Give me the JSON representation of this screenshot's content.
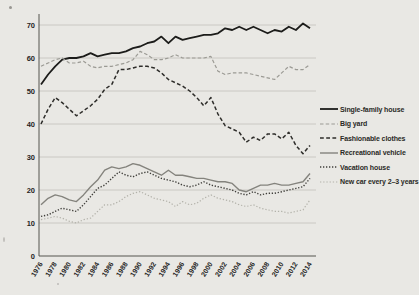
{
  "colors": {
    "background": "#e9e8e4",
    "grid": "#c6c5c0",
    "axis": "#55544e",
    "text": "#26251f"
  },
  "chart_data": {
    "type": "line",
    "title": "",
    "xlabel": "",
    "ylabel": "",
    "ylim": [
      0,
      70
    ],
    "yticks": [
      0,
      10,
      20,
      30,
      40,
      50,
      60,
      70
    ],
    "grid": "horizontal-only",
    "legend_position": "right",
    "x_tick_labels": [
      "1976",
      "1978",
      "1980",
      "1982",
      "1984",
      "1986",
      "1988",
      "1990",
      "1992",
      "1994",
      "1996",
      "1998",
      "2000",
      "2002",
      "2004",
      "2006",
      "2008",
      "2010",
      "2012",
      "2014"
    ],
    "x": [
      1976,
      1977,
      1978,
      1979,
      1980,
      1981,
      1982,
      1983,
      1984,
      1985,
      1986,
      1987,
      1988,
      1989,
      1990,
      1991,
      1992,
      1993,
      1994,
      1995,
      1996,
      1997,
      1998,
      1999,
      2000,
      2001,
      2002,
      2003,
      2004,
      2005,
      2006,
      2007,
      2008,
      2009,
      2010,
      2011,
      2012,
      2013,
      2014
    ],
    "series": [
      {
        "name": "Single-family house",
        "style": "solid",
        "color": "#1c1c1a",
        "width": 1.8,
        "dash": "",
        "values": [
          52,
          55,
          57.5,
          59.5,
          60,
          60,
          60.5,
          61.5,
          60.5,
          61,
          61.5,
          61.5,
          62,
          63,
          63.5,
          64.5,
          65,
          66.5,
          64.5,
          66.5,
          65.5,
          66,
          66.5,
          67,
          67,
          67.5,
          69,
          68.5,
          69.5,
          68.5,
          69.5,
          68.5,
          67.5,
          68.5,
          68,
          69.5,
          68.5,
          70.5,
          69
        ]
      },
      {
        "name": "Big yard",
        "style": "dashed",
        "color": "#9b9a94",
        "width": 1.2,
        "dash": "3.5,2.2",
        "values": [
          57.5,
          58.5,
          59.5,
          60,
          58.5,
          58.5,
          59,
          57.5,
          57,
          57.5,
          57.5,
          58,
          58.5,
          59.5,
          62,
          61,
          59.5,
          59.5,
          60,
          61,
          60,
          60,
          60,
          60,
          60.5,
          56,
          55,
          55.5,
          55.5,
          55.5,
          55,
          54.5,
          54,
          53.5,
          55.5,
          57.5,
          56.5,
          56.5,
          58
        ]
      },
      {
        "name": "Fashionable clothes",
        "style": "dashed",
        "color": "#2e2d2a",
        "width": 1.5,
        "dash": "3.8,2.4",
        "values": [
          40,
          44.5,
          48,
          46.5,
          44.5,
          42.5,
          44,
          45.5,
          47.5,
          50.5,
          52,
          56.5,
          56.5,
          57,
          57.5,
          57.5,
          57,
          55.5,
          53.5,
          52.5,
          51.5,
          50,
          48,
          45.5,
          48,
          43,
          39.5,
          38.5,
          37.5,
          34.5,
          36,
          35,
          37,
          37,
          35.5,
          37.5,
          33.5,
          31,
          33.5
        ]
      },
      {
        "name": "Recreational vehicle",
        "style": "solid",
        "color": "#84837d",
        "width": 1.4,
        "dash": "",
        "values": [
          15.5,
          17.5,
          18.5,
          18,
          17,
          16.5,
          18.5,
          21,
          23,
          26,
          27,
          26.5,
          27,
          28,
          27.5,
          26.5,
          25.5,
          24.5,
          26,
          24.5,
          24.5,
          24,
          23.5,
          23.5,
          23,
          22.5,
          22.5,
          22,
          20,
          19.5,
          20.5,
          21.5,
          21.5,
          22,
          21.5,
          21.5,
          22,
          22.5,
          25
        ]
      },
      {
        "name": "Vacation house",
        "style": "dotted",
        "color": "#3f3e3a",
        "width": 1.4,
        "dash": "1.3,1.7",
        "values": [
          12,
          12.5,
          13.5,
          14.5,
          14,
          13.5,
          15.5,
          18,
          20.5,
          21.5,
          23.5,
          25.5,
          24.5,
          24,
          25,
          25.5,
          24.5,
          23.5,
          23,
          22.5,
          21.5,
          21,
          21.5,
          22.5,
          21.5,
          21,
          20.5,
          20,
          19,
          18.5,
          19.5,
          18.5,
          19,
          19,
          19.5,
          20,
          20.5,
          21,
          23.5
        ]
      },
      {
        "name": "New car every 2–3 years",
        "style": "dotted",
        "color": "#b3b2aa",
        "width": 1.2,
        "dash": "1.3,1.9",
        "values": [
          11,
          11.5,
          12,
          11.5,
          10.5,
          10,
          11,
          11.5,
          13.5,
          15.5,
          15.5,
          16.5,
          18,
          19,
          19.5,
          18.5,
          17.5,
          17,
          16.5,
          15,
          16.5,
          15.5,
          16,
          17.5,
          18.5,
          17.5,
          17,
          16.5,
          15.5,
          15,
          15.5,
          14.5,
          14,
          13.5,
          13.5,
          13,
          13.5,
          14,
          17
        ]
      }
    ]
  }
}
